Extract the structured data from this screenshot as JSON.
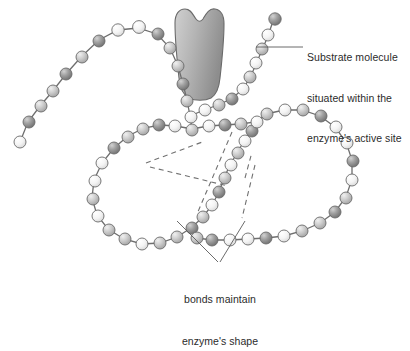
{
  "figure": {
    "background": "#ffffff"
  },
  "annotations": {
    "substrate": {
      "name": "substrate-label",
      "line1": "Substrate molecule",
      "line2": "situated within the",
      "line3": "enzyme's active site",
      "text": "Substrate molecule situated within the enzyme's active site"
    },
    "bonds": {
      "name": "bonds-label",
      "line1": "bonds maintain",
      "line2": "enzyme's shape",
      "text": "bonds maintain enzyme's shape"
    }
  },
  "colors": {
    "text": "#2b2b2b",
    "leader_line": "#5a5a5a",
    "chain_line": "#6e6e6e",
    "dashed_bond": "#707070",
    "bead_light": "#f2f2f2",
    "bead_medium": "#c2c2c2",
    "bead_dark": "#8a8a8a",
    "bead_outline": "#6b6b6b",
    "substrate_fill_light": "#c9c9c9",
    "substrate_fill_dark": "#8f8f8f",
    "substrate_outline": "#6a6a6a"
  },
  "elements": {
    "substrate_shape": "substrate-molecule",
    "chain": "polypeptide-bead-chain",
    "dashed_bonds": "hydrogen-bonds-dashed",
    "leader_substrate": "substrate-leader-line",
    "leader_bonds": "bonds-leader-lines"
  },
  "chain_data": {
    "type": "diagram",
    "description": "Polypeptide chain drawn as a string of shaded spheres forming two large loops with a free tail at upper left and a short tail at upper right; a gray substrate blob sits in the cleft at the top center.",
    "bead_count": 64,
    "tones": [
      "light",
      "medium",
      "dark"
    ]
  }
}
